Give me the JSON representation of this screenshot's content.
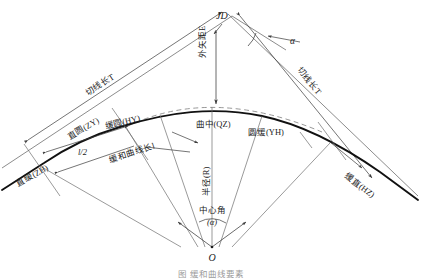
{
  "figure": {
    "caption": "图 缓和曲线要素"
  },
  "points": {
    "jd": "JD",
    "zh": "直缓(ZH)",
    "zy": "直圆(ZY)",
    "hy": "缓圆(HY)",
    "qz": "曲中(QZ)",
    "yh": "圆缓(YH)",
    "hz": "缓直(HZ)",
    "o": "O"
  },
  "elements": {
    "tangent_left": "切线长T",
    "tangent_right": "切线长T",
    "external": "外矢距E",
    "transition_len": "缓和曲线长l",
    "half_transition": "l/2",
    "radius": "半径(R)",
    "central_angle": "中心角",
    "central_angle_sym": "(α)",
    "deflection_angle": "α"
  },
  "colors": {
    "curve": "#111111",
    "construction": "#8c8c8c",
    "dashed": "#8c8c8c",
    "text": "#1b1b1b",
    "background": "#ffffff"
  }
}
